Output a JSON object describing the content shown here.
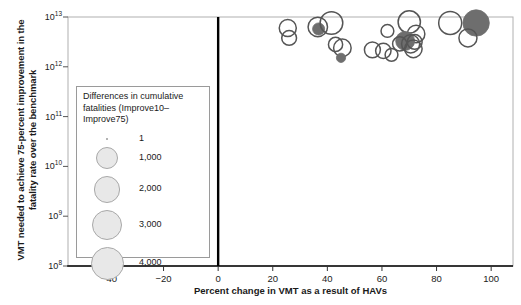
{
  "chart_data": {
    "type": "scatter",
    "title": "",
    "xlabel": "Percent change in VMT as a result of HAVs",
    "ylabel": "VMT needed to achieve 75-percent improvement in the fatality rate over the benchmark",
    "xlim": [
      -55,
      108
    ],
    "ylim_log": [
      8,
      13
    ],
    "yscale": "log",
    "grid": false,
    "xticks": [
      -40,
      -20,
      0,
      20,
      40,
      60,
      80,
      100
    ],
    "xtick_labels": [
      "−40",
      "−20",
      "0",
      "20",
      "40",
      "60",
      "80",
      "100"
    ],
    "ytick_labels": [
      "10¹³",
      "10¹²",
      "10¹¹",
      "10¹⁰",
      "10⁹",
      "10⁸"
    ],
    "ytick_exponents": [
      13,
      12,
      11,
      10,
      9,
      8
    ],
    "reference_line_x": 0,
    "points": [
      {
        "x": 25.5,
        "y_log": 12.78,
        "size": 1400,
        "filled": false
      },
      {
        "x": 26.0,
        "y_log": 12.58,
        "size": 1000,
        "filled": false
      },
      {
        "x": 36.5,
        "y_log": 12.8,
        "size": 1900,
        "filled": false
      },
      {
        "x": 36.8,
        "y_log": 12.76,
        "size": 600,
        "filled": true
      },
      {
        "x": 41.5,
        "y_log": 12.88,
        "size": 2700,
        "filled": false
      },
      {
        "x": 43.0,
        "y_log": 12.45,
        "size": 900,
        "filled": false
      },
      {
        "x": 45.5,
        "y_log": 12.38,
        "size": 1500,
        "filled": false
      },
      {
        "x": 45.0,
        "y_log": 12.18,
        "size": 300,
        "filled": true
      },
      {
        "x": 56.5,
        "y_log": 12.34,
        "size": 1200,
        "filled": false
      },
      {
        "x": 60.5,
        "y_log": 12.32,
        "size": 1100,
        "filled": false
      },
      {
        "x": 63.5,
        "y_log": 12.24,
        "size": 700,
        "filled": false
      },
      {
        "x": 62.0,
        "y_log": 12.72,
        "size": 700,
        "filled": false
      },
      {
        "x": 70.0,
        "y_log": 12.9,
        "size": 2600,
        "filled": false
      },
      {
        "x": 72.5,
        "y_log": 12.66,
        "size": 1500,
        "filled": false
      },
      {
        "x": 68.5,
        "y_log": 12.52,
        "size": 1800,
        "filled": true
      },
      {
        "x": 70.5,
        "y_log": 12.46,
        "size": 1600,
        "filled": false
      },
      {
        "x": 72.0,
        "y_log": 12.5,
        "size": 1000,
        "filled": false
      },
      {
        "x": 71.5,
        "y_log": 12.36,
        "size": 1500,
        "filled": false
      },
      {
        "x": 66.5,
        "y_log": 12.46,
        "size": 900,
        "filled": false
      },
      {
        "x": 85.0,
        "y_log": 12.88,
        "size": 2800,
        "filled": false
      },
      {
        "x": 94.5,
        "y_log": 12.88,
        "size": 3800,
        "filled": true
      },
      {
        "x": 91.5,
        "y_log": 12.58,
        "size": 1600,
        "filled": false
      }
    ]
  },
  "legend": {
    "title": "Differences in cumulative fatalities (Improve10–Improve75)",
    "entries": [
      {
        "label": "1",
        "size": 1
      },
      {
        "label": "1,000",
        "size": 1000
      },
      {
        "label": "2,000",
        "size": 2000
      },
      {
        "label": "3,000",
        "size": 3000
      },
      {
        "label": "4,000",
        "size": 4000
      }
    ]
  },
  "colors": {
    "bubble_outline": "#555555",
    "bubble_fill": "#6e6e6e",
    "axis": "#000000",
    "frame": "#b0b0b0",
    "legend_bubble_fill": "#e8e8e8",
    "legend_bubble_outline": "#a8a8a8"
  }
}
